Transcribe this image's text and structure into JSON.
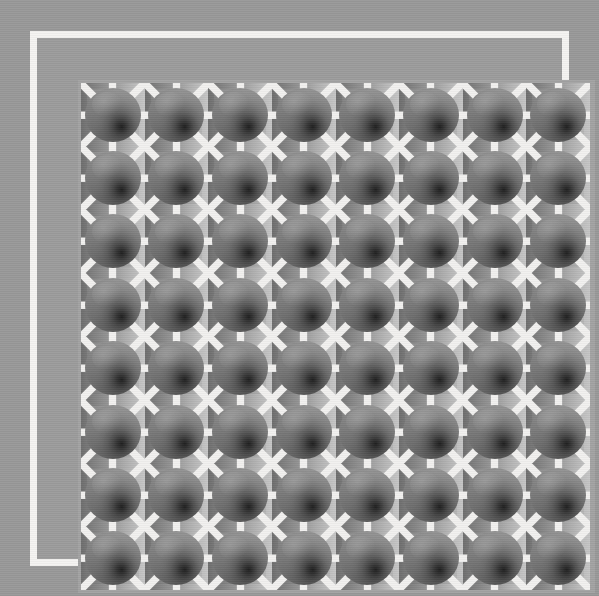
{
  "image": {
    "title": "Shaded sphere lattice",
    "description": "An eight by eight grid of grey shaded spheres set on square tiles, joined by white orthogonal and diagonal rays, inside a white rectangular frame on a grey background.",
    "width": 599,
    "height": 596
  },
  "colors": {
    "page_background": "#999999",
    "frame_border": "#f5f4f2",
    "frame_fill": "#9c9c9c",
    "inner_band": "#a3a3a3",
    "grid_background": "#9e9e9e",
    "ray": "#f2f1ef",
    "plate_dark": "#6e6e6e",
    "plate_light": "#c6c6c6",
    "sphere_shadow": "#1d1d1d",
    "sphere_light": "#a0a0a0"
  },
  "frame": {
    "border_width_px": 7,
    "left_px": 30,
    "top_px": 31,
    "width_px": 539,
    "height_px": 535
  },
  "grid": {
    "rows": 8,
    "columns": 8,
    "cell_count": 64,
    "left_px": 44,
    "top_px": 45,
    "width_px": 509,
    "height_px": 507,
    "cell_size_px": 63.6
  },
  "tile": {
    "sphere_diameter_px": 56,
    "ray_count": 8,
    "ray_width_px": 7,
    "ray_angles_deg": [
      0,
      45,
      90,
      135,
      180,
      225,
      270,
      315
    ],
    "plate_gradient_direction": "left-dark-to-right-light",
    "sphere_highlight_position": "upper-left",
    "sphere_shadow_position": "lower-right-of-center"
  },
  "cells": [
    {
      "row": 1,
      "col": 1
    },
    {
      "row": 1,
      "col": 2
    },
    {
      "row": 1,
      "col": 3
    },
    {
      "row": 1,
      "col": 4
    },
    {
      "row": 1,
      "col": 5
    },
    {
      "row": 1,
      "col": 6
    },
    {
      "row": 1,
      "col": 7
    },
    {
      "row": 1,
      "col": 8
    },
    {
      "row": 2,
      "col": 1
    },
    {
      "row": 2,
      "col": 2
    },
    {
      "row": 2,
      "col": 3
    },
    {
      "row": 2,
      "col": 4
    },
    {
      "row": 2,
      "col": 5
    },
    {
      "row": 2,
      "col": 6
    },
    {
      "row": 2,
      "col": 7
    },
    {
      "row": 2,
      "col": 8
    },
    {
      "row": 3,
      "col": 1
    },
    {
      "row": 3,
      "col": 2
    },
    {
      "row": 3,
      "col": 3
    },
    {
      "row": 3,
      "col": 4
    },
    {
      "row": 3,
      "col": 5
    },
    {
      "row": 3,
      "col": 6
    },
    {
      "row": 3,
      "col": 7
    },
    {
      "row": 3,
      "col": 8
    },
    {
      "row": 4,
      "col": 1
    },
    {
      "row": 4,
      "col": 2
    },
    {
      "row": 4,
      "col": 3
    },
    {
      "row": 4,
      "col": 4
    },
    {
      "row": 4,
      "col": 5
    },
    {
      "row": 4,
      "col": 6
    },
    {
      "row": 4,
      "col": 7
    },
    {
      "row": 4,
      "col": 8
    },
    {
      "row": 5,
      "col": 1
    },
    {
      "row": 5,
      "col": 2
    },
    {
      "row": 5,
      "col": 3
    },
    {
      "row": 5,
      "col": 4
    },
    {
      "row": 5,
      "col": 5
    },
    {
      "row": 5,
      "col": 6
    },
    {
      "row": 5,
      "col": 7
    },
    {
      "row": 5,
      "col": 8
    },
    {
      "row": 6,
      "col": 1
    },
    {
      "row": 6,
      "col": 2
    },
    {
      "row": 6,
      "col": 3
    },
    {
      "row": 6,
      "col": 4
    },
    {
      "row": 6,
      "col": 5
    },
    {
      "row": 6,
      "col": 6
    },
    {
      "row": 6,
      "col": 7
    },
    {
      "row": 6,
      "col": 8
    },
    {
      "row": 7,
      "col": 1
    },
    {
      "row": 7,
      "col": 2
    },
    {
      "row": 7,
      "col": 3
    },
    {
      "row": 7,
      "col": 4
    },
    {
      "row": 7,
      "col": 5
    },
    {
      "row": 7,
      "col": 6
    },
    {
      "row": 7,
      "col": 7
    },
    {
      "row": 7,
      "col": 8
    },
    {
      "row": 8,
      "col": 1
    },
    {
      "row": 8,
      "col": 2
    },
    {
      "row": 8,
      "col": 3
    },
    {
      "row": 8,
      "col": 4
    },
    {
      "row": 8,
      "col": 5
    },
    {
      "row": 8,
      "col": 6
    },
    {
      "row": 8,
      "col": 7
    },
    {
      "row": 8,
      "col": 8
    }
  ]
}
